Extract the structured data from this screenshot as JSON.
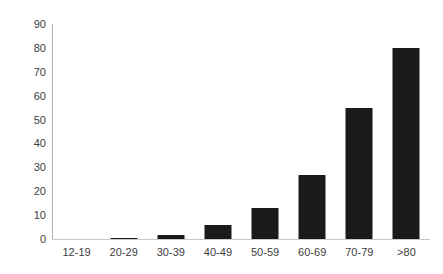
{
  "chart_data": {
    "type": "bar",
    "title": "",
    "subtitle": "",
    "xlabel": "",
    "ylabel": "",
    "categories": [
      "12-19",
      "20-29",
      "30-39",
      "40-49",
      "50-59",
      "60-69",
      "70-79",
      ">80"
    ],
    "values": [
      0,
      0.4,
      1.7,
      6,
      13,
      27,
      55,
      80
    ],
    "series": [
      {
        "name": "",
        "values": [
          0,
          0.4,
          1.7,
          6,
          13,
          27,
          55,
          80
        ]
      }
    ],
    "ylim": [
      0,
      90
    ],
    "ytick_labels": [
      "90",
      "80",
      "70",
      "60",
      "50",
      "40",
      "30",
      "20",
      "10",
      "0"
    ],
    "ytick_values": [
      90,
      80,
      70,
      60,
      50,
      40,
      30,
      20,
      10,
      0
    ],
    "ytick_step": 10,
    "grid": false,
    "legend": false,
    "legend_position": "none",
    "bar_color": "#1a1a1a",
    "axis_color": "#b3b3b3",
    "background_color": "#ffffff",
    "annotations": []
  }
}
